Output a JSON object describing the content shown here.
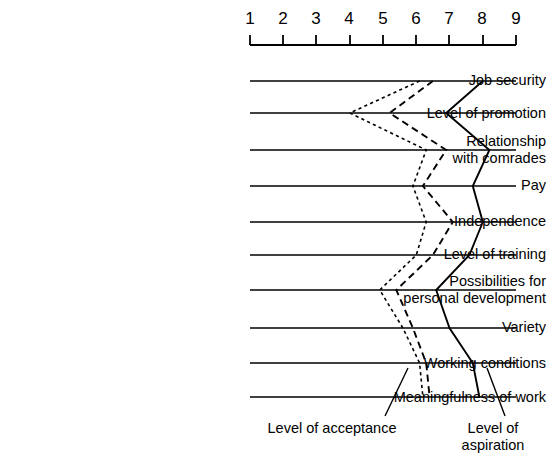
{
  "chart_data": {
    "type": "line",
    "title": "",
    "subtitle": "",
    "orientation": "horizontal",
    "xlabel": "",
    "ylabel": "",
    "xlim": [
      1,
      9
    ],
    "grid": true,
    "grid_axis": "y-rows",
    "legend_position": "below-right",
    "xticks": [
      "1",
      "2",
      "3",
      "4",
      "5",
      "6",
      "7",
      "8",
      "9"
    ],
    "categories": [
      "Job security",
      "Level of promotion",
      "Relationship\nwith comrades",
      "Pay",
      "Independence",
      "Level of training",
      "Possibilities for\npersonal development",
      "Variety",
      "Working conditions",
      "Meaningfulness of work"
    ],
    "annotations": [
      "Level of acceptance",
      "Level of aspiration"
    ],
    "series": [
      {
        "name": "Level of aspiration",
        "style": "solid",
        "values": [
          8.0,
          6.9,
          8.2,
          7.7,
          8.0,
          7.6,
          6.6,
          7.0,
          7.7,
          7.9
        ]
      },
      {
        "name": "Level of acceptance (dashed)",
        "style": "dashed",
        "values": [
          6.5,
          5.2,
          6.9,
          6.2,
          7.1,
          6.5,
          5.4,
          5.9,
          6.3,
          6.4
        ]
      },
      {
        "name": "Level of acceptance (dotted)",
        "style": "dotted",
        "values": [
          6.1,
          4.0,
          6.3,
          5.9,
          6.3,
          6.0,
          4.9,
          5.6,
          6.1,
          6.2
        ]
      }
    ]
  },
  "axis": {
    "start_value": 1,
    "end_value": 9,
    "tick_labels": [
      "1",
      "2",
      "3",
      "4",
      "5",
      "6",
      "7",
      "8",
      "9"
    ]
  },
  "captions": {
    "acceptance": "Level of acceptance",
    "aspiration": "Level of\naspiration"
  }
}
